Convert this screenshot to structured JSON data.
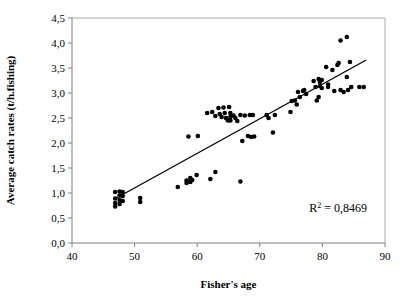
{
  "chart_data": {
    "type": "scatter",
    "title": "",
    "xlabel": "Fisher's age",
    "ylabel": "Average catch rates (t/h.fishing)",
    "xlim": [
      40,
      90
    ],
    "ylim": [
      0.0,
      4.5
    ],
    "xticks": [
      "40",
      "50",
      "60",
      "70",
      "80",
      "90"
    ],
    "xtick_values": [
      40,
      50,
      60,
      70,
      80,
      90
    ],
    "yticks": [
      "0,0",
      "0,5",
      "1,0",
      "1,5",
      "2,0",
      "2,5",
      "3,0",
      "3,5",
      "4,0",
      "4,5"
    ],
    "ytick_values": [
      0.0,
      0.5,
      1.0,
      1.5,
      2.0,
      2.5,
      3.0,
      3.5,
      4.0,
      4.5
    ],
    "grid": false,
    "legend": null,
    "marker": "filled-circle",
    "marker_color": "#000000",
    "annotations": [
      {
        "name": "r-squared",
        "text": "R2 = 0,8469",
        "base": "R",
        "superscript": "2",
        "rest": " = 0,8469",
        "x": 82.5,
        "y": 0.62
      }
    ],
    "trendline": {
      "type": "linear",
      "x": [
        46.8,
        87.0
      ],
      "y": [
        0.88,
        3.66
      ],
      "r_squared": 0.8469,
      "color": "#000000"
    },
    "points": [
      [
        46.9,
        1.02
      ],
      [
        46.9,
        0.89
      ],
      [
        46.9,
        0.8
      ],
      [
        46.9,
        0.73
      ],
      [
        47.6,
        1.03
      ],
      [
        47.6,
        0.95
      ],
      [
        47.6,
        0.86
      ],
      [
        47.6,
        0.78
      ],
      [
        48.1,
        1.02
      ],
      [
        48.1,
        0.94
      ],
      [
        48.1,
        0.84
      ],
      [
        50.9,
        0.9
      ],
      [
        50.9,
        0.82
      ],
      [
        56.9,
        1.12
      ],
      [
        58.3,
        1.2
      ],
      [
        58.3,
        1.25
      ],
      [
        58.6,
        2.13
      ],
      [
        58.9,
        1.3
      ],
      [
        58.9,
        1.22
      ],
      [
        59.2,
        1.26
      ],
      [
        59.9,
        1.36
      ],
      [
        60.1,
        2.14
      ],
      [
        61.6,
        2.6
      ],
      [
        62.1,
        1.28
      ],
      [
        62.4,
        2.62
      ],
      [
        62.9,
        2.54
      ],
      [
        62.9,
        1.42
      ],
      [
        63.4,
        2.7
      ],
      [
        63.6,
        2.58
      ],
      [
        63.9,
        2.52
      ],
      [
        64.2,
        2.71
      ],
      [
        64.4,
        2.6
      ],
      [
        64.6,
        2.5
      ],
      [
        64.9,
        2.45
      ],
      [
        65.1,
        2.72
      ],
      [
        65.3,
        2.6
      ],
      [
        65.3,
        2.52
      ],
      [
        65.3,
        2.45
      ],
      [
        65.8,
        2.55
      ],
      [
        66.1,
        2.5
      ],
      [
        66.4,
        2.44
      ],
      [
        66.9,
        2.56
      ],
      [
        66.9,
        1.23
      ],
      [
        67.2,
        2.04
      ],
      [
        67.6,
        2.55
      ],
      [
        68.1,
        2.14
      ],
      [
        68.4,
        2.56
      ],
      [
        68.6,
        2.12
      ],
      [
        68.9,
        2.56
      ],
      [
        69.1,
        2.13
      ],
      [
        71.1,
        2.56
      ],
      [
        71.4,
        2.5
      ],
      [
        72.1,
        2.21
      ],
      [
        72.4,
        2.56
      ],
      [
        74.9,
        2.62
      ],
      [
        75.1,
        2.84
      ],
      [
        75.6,
        2.85
      ],
      [
        75.9,
        2.77
      ],
      [
        76.1,
        3.02
      ],
      [
        76.4,
        2.92
      ],
      [
        76.9,
        3.04
      ],
      [
        77.1,
        3.06
      ],
      [
        77.4,
        2.98
      ],
      [
        78.6,
        3.24
      ],
      [
        78.9,
        3.12
      ],
      [
        79.1,
        2.85
      ],
      [
        79.4,
        3.28
      ],
      [
        79.6,
        3.22
      ],
      [
        79.6,
        3.14
      ],
      [
        79.9,
        3.26
      ],
      [
        79.9,
        3.1
      ],
      [
        79.4,
        2.92
      ],
      [
        80.6,
        3.52
      ],
      [
        80.9,
        3.17
      ],
      [
        80.9,
        3.12
      ],
      [
        81.6,
        3.46
      ],
      [
        81.9,
        3.04
      ],
      [
        82.4,
        3.56
      ],
      [
        82.6,
        3.6
      ],
      [
        82.9,
        4.05
      ],
      [
        82.9,
        3.06
      ],
      [
        83.4,
        3.02
      ],
      [
        83.9,
        4.12
      ],
      [
        83.9,
        3.32
      ],
      [
        84.1,
        3.06
      ],
      [
        84.4,
        3.62
      ],
      [
        84.6,
        3.12
      ],
      [
        85.9,
        3.12
      ],
      [
        86.6,
        3.12
      ]
    ]
  }
}
